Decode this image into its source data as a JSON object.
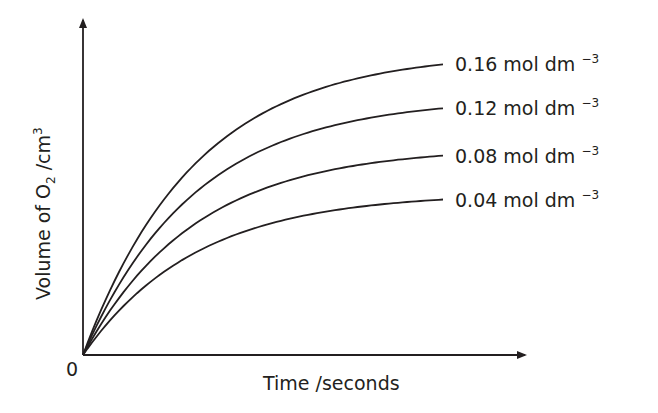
{
  "chart_data": {
    "type": "line",
    "title": "",
    "xlabel": "Time /seconds",
    "ylabel": "Volume of O2 /cm3",
    "ylabel_parts": {
      "pre": "Volume of O",
      "sub": "2",
      "mid": " /cm",
      "sup": "3"
    },
    "origin_label": "0",
    "grid": false,
    "legend_position": "inline-right-of-curves",
    "axis_ticks": "none (qualitative sketch)",
    "x": [
      0,
      0.1,
      0.2,
      0.3,
      0.4,
      0.5,
      0.6,
      0.7,
      0.8,
      0.9,
      1.0
    ],
    "series": [
      {
        "name": "0.16 mol dm -3",
        "concentration": "0.16",
        "unit": "mol dm",
        "exp": "−3",
        "plateau_fraction": 0.86,
        "values": [
          0,
          0.42,
          0.63,
          0.75,
          0.81,
          0.84,
          0.855,
          0.86,
          0.86,
          0.86,
          0.86
        ]
      },
      {
        "name": "0.12 mol dm -3",
        "concentration": "0.12",
        "unit": "mol dm",
        "exp": "−3",
        "plateau_fraction": 0.73,
        "values": [
          0,
          0.37,
          0.54,
          0.63,
          0.68,
          0.71,
          0.72,
          0.73,
          0.73,
          0.73,
          0.73
        ]
      },
      {
        "name": "0.08 mol dm -3",
        "concentration": "0.08",
        "unit": "mol dm",
        "exp": "−3",
        "plateau_fraction": 0.59,
        "values": [
          0,
          0.31,
          0.43,
          0.5,
          0.54,
          0.57,
          0.58,
          0.59,
          0.59,
          0.59,
          0.59
        ]
      },
      {
        "name": "0.04 mol dm -3",
        "concentration": "0.04",
        "unit": "mol dm",
        "exp": "−3",
        "plateau_fraction": 0.46,
        "values": [
          0,
          0.24,
          0.33,
          0.39,
          0.42,
          0.44,
          0.45,
          0.46,
          0.46,
          0.46,
          0.46
        ]
      }
    ]
  },
  "colors": {
    "ink": "#231f20",
    "background": "#ffffff"
  }
}
